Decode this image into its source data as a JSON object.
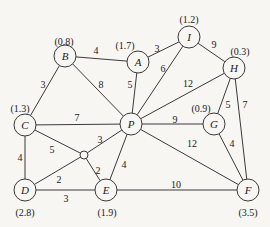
{
  "diagram": {
    "type": "weighted-graph",
    "nodes": [
      {
        "id": "B",
        "label": "B",
        "weight": "(0.8)",
        "x": 65,
        "y": 56,
        "wx": 64,
        "wy": 41
      },
      {
        "id": "A",
        "label": "A",
        "weight": "(1.7)",
        "x": 138,
        "y": 62,
        "wx": 125,
        "wy": 45
      },
      {
        "id": "I",
        "label": "I",
        "weight": "(1.2)",
        "x": 189,
        "y": 37,
        "wx": 189,
        "wy": 19
      },
      {
        "id": "H",
        "label": "H",
        "weight": "(0.3)",
        "x": 234,
        "y": 68,
        "wx": 240,
        "wy": 51
      },
      {
        "id": "C",
        "label": "C",
        "weight": "(1.3)",
        "x": 25,
        "y": 125,
        "wx": 20,
        "wy": 108
      },
      {
        "id": "P",
        "label": "P",
        "weight": "",
        "x": 131,
        "y": 124,
        "wx": 0,
        "wy": 0
      },
      {
        "id": "G",
        "label": "G",
        "weight": "(0.9)",
        "x": 214,
        "y": 124,
        "wx": 201,
        "wy": 108
      },
      {
        "id": "D",
        "label": "D",
        "weight": "(2.8)",
        "x": 25,
        "y": 190,
        "wx": 25,
        "wy": 212
      },
      {
        "id": "E",
        "label": "E",
        "weight": "(1.9)",
        "x": 106,
        "y": 190,
        "wx": 107,
        "wy": 212
      },
      {
        "id": "F",
        "label": "F",
        "weight": "(3.5)",
        "x": 248,
        "y": 190,
        "wx": 248,
        "wy": 212
      }
    ],
    "junction": {
      "x": 84,
      "y": 155,
      "r": 4
    },
    "edges": [
      {
        "from": "B",
        "to": "A",
        "label": "4",
        "lx": 96,
        "ly": 50
      },
      {
        "from": "B",
        "to": "C",
        "label": "3",
        "lx": 43,
        "ly": 84
      },
      {
        "from": "B",
        "to": "P",
        "label": "8",
        "lx": 101,
        "ly": 84
      },
      {
        "from": "A",
        "to": "P",
        "label": "5",
        "lx": 130,
        "ly": 84
      },
      {
        "from": "A",
        "to": "I",
        "label": "3",
        "lx": 157,
        "ly": 48
      },
      {
        "from": "I",
        "to": "P",
        "label": "6",
        "lx": 163,
        "ly": 68
      },
      {
        "from": "I",
        "to": "H",
        "label": "9",
        "lx": 214,
        "ly": 44
      },
      {
        "from": "H",
        "to": "P",
        "label": "12",
        "lx": 188,
        "ly": 83
      },
      {
        "from": "H",
        "to": "G",
        "label": "5",
        "lx": 228,
        "ly": 104
      },
      {
        "from": "H",
        "to": "F",
        "label": "7",
        "lx": 245,
        "ly": 104
      },
      {
        "from": "C",
        "to": "P",
        "label": "7",
        "lx": 77,
        "ly": 117
      },
      {
        "from": "P",
        "to": "G",
        "label": "9",
        "lx": 175,
        "ly": 119
      },
      {
        "from": "P",
        "to": "F",
        "label": "12",
        "lx": 192,
        "ly": 143
      },
      {
        "from": "G",
        "to": "F",
        "label": "4",
        "lx": 232,
        "ly": 143
      },
      {
        "from": "C",
        "to": "J",
        "label": "5",
        "lx": 52,
        "ly": 149
      },
      {
        "from": "P",
        "to": "J",
        "label": "3",
        "lx": 100,
        "ly": 139
      },
      {
        "from": "D",
        "to": "J",
        "label": "2",
        "lx": 59,
        "ly": 179
      },
      {
        "from": "J",
        "to": "E",
        "label": "2",
        "lx": 98,
        "ly": 170
      },
      {
        "from": "C",
        "to": "D",
        "label": "4",
        "lx": 20,
        "ly": 157
      },
      {
        "from": "D",
        "to": "E",
        "label": "3",
        "lx": 66,
        "ly": 198
      },
      {
        "from": "E",
        "to": "P",
        "label": "4",
        "lx": 124,
        "ly": 164
      },
      {
        "from": "E",
        "to": "F",
        "label": "10",
        "lx": 176,
        "ly": 184
      }
    ],
    "node_radius": 11,
    "colors": {
      "stroke": "#3a3a3a",
      "background": "#f7f6f2",
      "text": "#222222"
    }
  }
}
